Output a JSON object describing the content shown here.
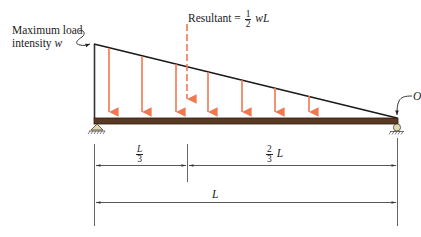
{
  "diagram": {
    "labels": {
      "max_load_line1": "Maximum load",
      "max_load_line2": "intensity",
      "max_load_symbol": "w",
      "resultant_text": "Resultant =",
      "resultant_num": "1",
      "resultant_den": "2",
      "resultant_tail": "wL",
      "point_o": "O",
      "dim_third_num": "L",
      "dim_third_den": "3",
      "dim_two_thirds_num": "2",
      "dim_two_thirds_den": "3",
      "dim_two_thirds_tail": "L",
      "dim_total": "L"
    },
    "colors": {
      "load_arrow": "#f07850",
      "beam": "#5a3a22",
      "beam_edge": "#2a1a0e",
      "line": "#222222",
      "dimension_line": "#555555",
      "support_fill": "#e6d8a8"
    },
    "load_arrow_positions_x": [
      109,
      142,
      176,
      208,
      242,
      275,
      309
    ],
    "resultant_position_x": 187
  }
}
